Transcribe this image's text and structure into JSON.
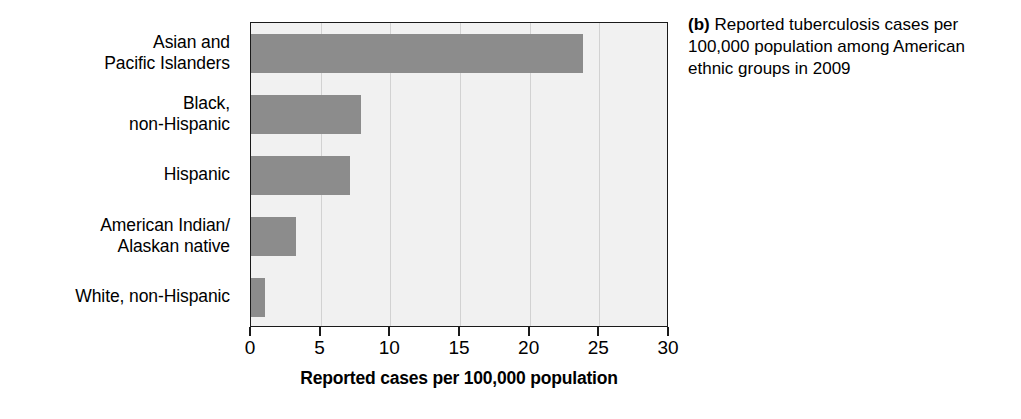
{
  "caption": {
    "tag": "(b)",
    "text": " Reported tuberculosis cases per 100,000 population among American ethnic groups in 2009"
  },
  "chart_data": {
    "type": "bar",
    "orientation": "horizontal",
    "title": "",
    "subtitle": "",
    "xlabel": "Reported cases per 100,000 population",
    "ylabel": "",
    "categories": [
      "Asian and\nPacific Islanders",
      "Black,\nnon-Hispanic",
      "Hispanic",
      "American Indian/\nAlaskan native",
      "White, non-Hispanic"
    ],
    "values": [
      23.8,
      7.9,
      7.1,
      3.2,
      1.0
    ],
    "xlim": [
      0,
      30
    ],
    "xticks": [
      0,
      5,
      10,
      15,
      20,
      25,
      30
    ],
    "xticklabels": [
      "0",
      "5",
      "10",
      "15",
      "20",
      "25",
      "30"
    ],
    "grid": "vertical",
    "legend": "none",
    "bar_color": "#8c8c8c",
    "plot_background": "#f1f1f1",
    "gridline_color": "#d2d2d2",
    "axis_color": "#1a1a1a"
  }
}
